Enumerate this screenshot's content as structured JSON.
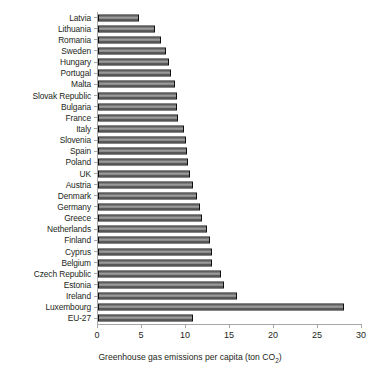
{
  "chart_data": {
    "type": "bar",
    "orientation": "horizontal",
    "title": "",
    "xlabel": "Greenhouse gas emissions per capita (ton CO2)",
    "xlabel_main": "Greenhouse gas emissions per capita (ton CO",
    "xlabel_sub": "2",
    "xlabel_tail": ")",
    "ylabel": "",
    "xlim": [
      0,
      30
    ],
    "xticks": [
      0,
      5,
      10,
      15,
      20,
      25,
      30
    ],
    "xtick_labels": [
      "0",
      "5",
      "10",
      "15",
      "20",
      "25",
      "30"
    ],
    "grid": false,
    "legend": false,
    "categories": [
      "Latvia",
      "Lithuania",
      "Romania",
      "Sweden",
      "Hungary",
      "Portugal",
      "Malta",
      "Slovak Republic",
      "Bulgaria",
      "France",
      "Italy",
      "Slovenia",
      "Spain",
      "Poland",
      "UK",
      "Austria",
      "Denmark",
      "Germany",
      "Greece",
      "Netherlands",
      "Finland",
      "Cyprus",
      "Belgium",
      "Czech Republic",
      "Estonia",
      "Ireland",
      "Luxembourg",
      "EU-27"
    ],
    "values": [
      4.7,
      6.5,
      7.2,
      7.7,
      8.1,
      8.3,
      8.7,
      9.0,
      9.0,
      9.1,
      9.8,
      10.0,
      10.1,
      10.2,
      10.5,
      10.8,
      11.3,
      11.6,
      11.8,
      12.4,
      12.7,
      12.9,
      13.0,
      14.0,
      14.3,
      15.8,
      28.0,
      10.8
    ],
    "bar_color": "#8c8c8c",
    "bar_edge_color": "#0f0f0f",
    "axis_color": "#a6a6a6"
  }
}
